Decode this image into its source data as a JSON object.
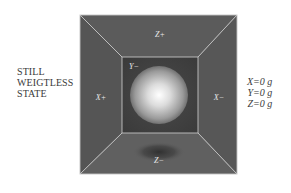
{
  "state_caption": {
    "lines": [
      "STILL",
      "WEIGTLESS",
      "STATE"
    ]
  },
  "readout": {
    "lines": [
      "X=0 g",
      "Y=0 g",
      "Z=0 g"
    ],
    "x": "X=0 g",
    "y": "Y=0 g",
    "z": "Z=0 g"
  },
  "faces": {
    "top": "Z+",
    "bottom": "Z−",
    "left": "X+",
    "right": "X−",
    "back": "Y−"
  },
  "colors": {
    "background": "#ffffff",
    "face_top": "#5a5a5a",
    "face_side": "#555555",
    "face_bottom": "#5e5e5e",
    "back_wall": "#3e3e3e",
    "edge_lines": "#bdbdbd",
    "sphere_highlight": "#ffffff",
    "sphere_shadow": "#4a4a4a",
    "text": "#3a3a3a"
  }
}
